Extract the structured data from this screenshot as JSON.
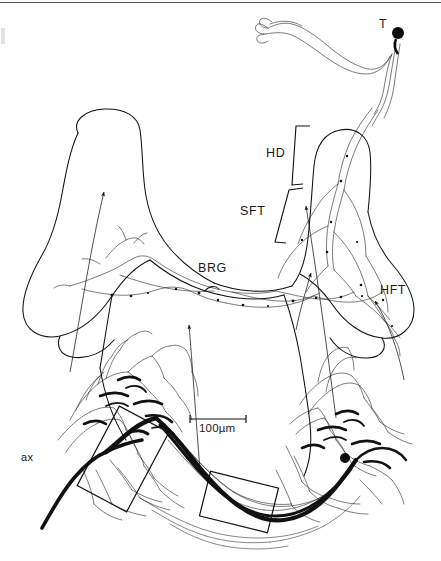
{
  "figure": {
    "type": "neuroanatomical-line-drawing",
    "background_color": "#ffffff",
    "ink_color": "#000000",
    "scalebar": {
      "label": "100µm",
      "length_px": 56,
      "x": 190,
      "y": 419
    },
    "labels": [
      {
        "id": "T",
        "text": "T",
        "x": 379,
        "y": 24,
        "meaning": "soma / cell body of T neuron"
      },
      {
        "id": "HD",
        "text": "HD",
        "x": 266,
        "y": 153,
        "meaning": "horizontal dendrite region"
      },
      {
        "id": "SFT",
        "text": "SFT",
        "x": 243,
        "y": 211,
        "meaning": "soft / segmental fibre tract"
      },
      {
        "id": "BRG",
        "text": "BRG",
        "x": 200,
        "y": 268,
        "meaning": "bridge region"
      },
      {
        "id": "HFT",
        "text": "HFT",
        "x": 383,
        "y": 290,
        "meaning": "horizontal fibre tract"
      },
      {
        "id": "ax",
        "text": "ax",
        "x": 22,
        "y": 457,
        "meaning": "axon"
      }
    ],
    "brackets": [
      {
        "id": "HD-bracket",
        "label_ref": "HD",
        "top_y": 125,
        "bottom_y": 185
      },
      {
        "id": "SFT-bracket",
        "label_ref": "SFT",
        "top_y": 188,
        "bottom_y": 243
      }
    ],
    "inset_boxes": [
      {
        "id": "inset-box-left",
        "cx": 123,
        "cy": 459,
        "w": 56,
        "h": 90,
        "rotation_deg": 28
      },
      {
        "id": "inset-box-bottom",
        "cx": 239,
        "cy": 502,
        "w": 70,
        "h": 46,
        "rotation_deg": 14
      }
    ],
    "somata": [
      {
        "id": "soma-T",
        "x": 398,
        "y": 33,
        "r": 6.0
      },
      {
        "id": "soma-right",
        "x": 345,
        "y": 458,
        "r": 5.0
      }
    ],
    "leader_arrows": [
      {
        "id": "arrow-to-left-lobe",
        "tip_x": 108,
        "tip_y": 185
      },
      {
        "id": "arrow-to-brg",
        "tip_x": 189,
        "tip_y": 319
      },
      {
        "id": "arrow-to-sft",
        "tip_x": 305,
        "tip_y": 200
      },
      {
        "id": "arrow-to-hft",
        "tip_x": 373,
        "tip_y": 296
      },
      {
        "id": "arrow-to-mid-right",
        "tip_x": 312,
        "tip_y": 267
      }
    ]
  }
}
